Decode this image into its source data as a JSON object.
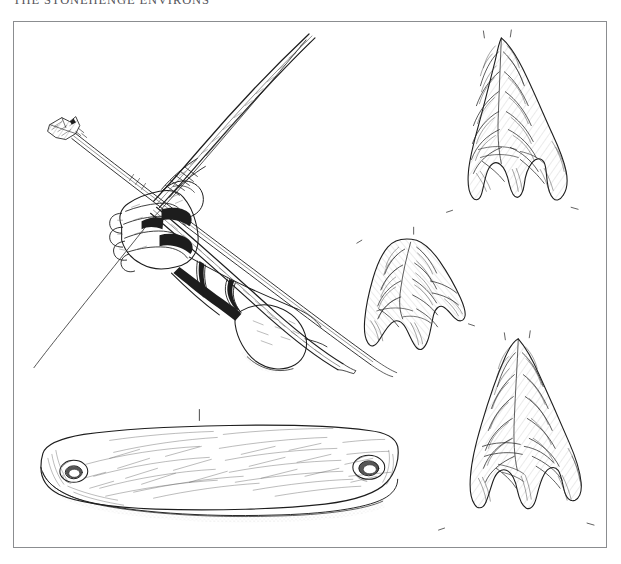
{
  "page": {
    "running_head": "THE STONEHENGE ENVIRONS",
    "background_color": "#ffffff",
    "ink_color": "#1d1d1d",
    "frame_color": "#8b8d90"
  },
  "figure": {
    "name": "archery-equipment-plate",
    "border": true,
    "items": [
      {
        "id": "bow-and-arrow-drawing",
        "label": "Hand drawing a bow with nocked arrow and wrist-guard",
        "position": "upper-left"
      },
      {
        "id": "arrowhead-upper-right",
        "label": "Barbed-and-tanged flint arrowhead",
        "position": "upper-right"
      },
      {
        "id": "arrowhead-middle",
        "label": "Barbed-and-tanged flint arrowhead",
        "position": "centre"
      },
      {
        "id": "arrowhead-lower-right",
        "label": "Barbed-and-tanged flint arrowhead",
        "position": "lower-right"
      },
      {
        "id": "stone-wrist-guard",
        "label": "Perforated stone archer's wrist-guard (bracer)",
        "position": "lower-left"
      }
    ]
  }
}
